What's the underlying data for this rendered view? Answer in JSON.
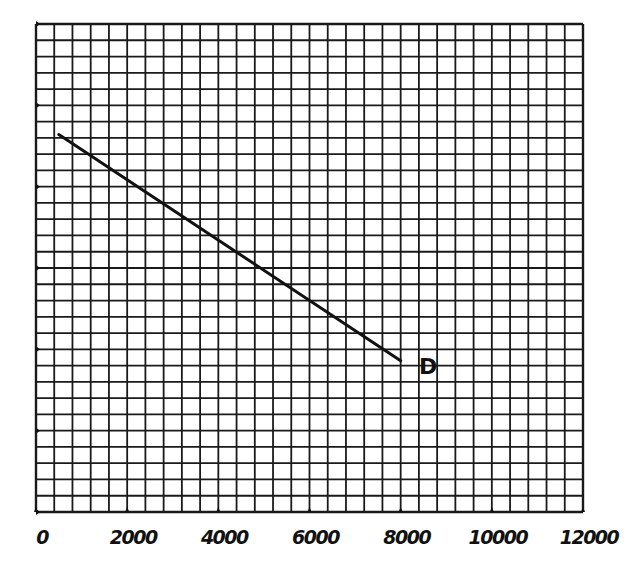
{
  "chart_data": {
    "type": "line",
    "title": "",
    "xlabel": "",
    "ylabel": "",
    "xlim": [
      0,
      12000
    ],
    "ylim": [
      0,
      30
    ],
    "x_ticks": [
      0,
      2000,
      4000,
      6000,
      8000,
      10000,
      12000
    ],
    "x_tick_labels": [
      "0",
      "2000",
      "4000",
      "6000",
      "8000",
      "10000",
      "12000"
    ],
    "y_ticks": [
      0,
      5,
      10,
      15,
      20,
      25,
      30
    ],
    "y_tick_labels": [],
    "grid": {
      "on": true,
      "x_divisions": 30,
      "y_divisions": 30
    },
    "series": [
      {
        "name": "D",
        "x": [
          500,
          8000
        ],
        "y": [
          23.2,
          9.3
        ]
      }
    ],
    "annotations": [
      {
        "text": "D",
        "x": 8400,
        "y": 8.5
      }
    ],
    "colors": {
      "line": "#111111",
      "grid": "#1a1a1a",
      "background": "#ffffff"
    }
  }
}
